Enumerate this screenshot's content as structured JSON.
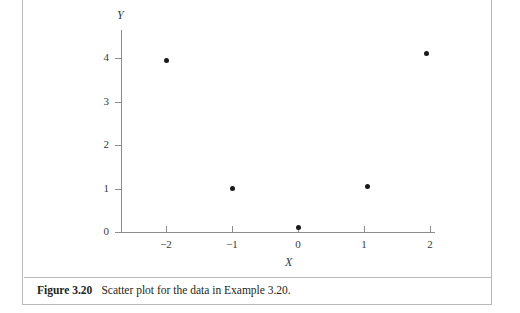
{
  "figure": {
    "caption_label": "Figure 3.20",
    "caption_text": "Scatter plot for the data in Example 3.20.",
    "border_color": "#b9b9b9"
  },
  "chart_data": {
    "type": "scatter",
    "title": "",
    "xlabel": "X",
    "ylabel": "Y",
    "xlim": [
      -2.45,
      2.45
    ],
    "ylim": [
      -0.25,
      4.4
    ],
    "xticks": [
      -2,
      -1,
      0,
      1,
      2
    ],
    "xticklabels": [
      "−2",
      "−1",
      "0",
      "1",
      "2"
    ],
    "yticks": [
      0,
      1,
      2,
      3,
      4
    ],
    "yticklabels": [
      "0",
      "1",
      "2",
      "3",
      "4"
    ],
    "grid": false,
    "legend": false,
    "marker_color": "#1a1a1a",
    "axis_color": "#8d8d8d",
    "points": [
      {
        "x": -2.0,
        "y": 3.95
      },
      {
        "x": -1.0,
        "y": 1.0
      },
      {
        "x": 0.0,
        "y": 0.1
      },
      {
        "x": 1.05,
        "y": 1.05
      },
      {
        "x": 1.94,
        "y": 4.1
      }
    ],
    "x": [
      -2.0,
      -1.0,
      0.0,
      1.05,
      1.94
    ],
    "y": [
      3.95,
      1.0,
      0.1,
      1.05,
      4.1
    ]
  }
}
